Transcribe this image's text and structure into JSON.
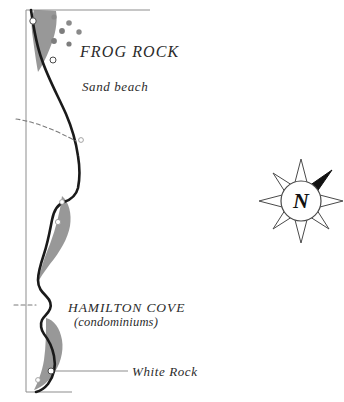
{
  "map": {
    "type": "coastal-illustration-map",
    "background_color": "#ffffff",
    "frame_color": "#8d8d8d",
    "coastline_color": "#1a1a1a",
    "shore_fill_color": "#8f8f8f",
    "trail_color": "#6e6e6e",
    "label_color": "#2b2b2b",
    "labels": [
      {
        "id": "frog-rock",
        "text": "FROG ROCK",
        "style": "italic-caps",
        "x": 80,
        "y": 43
      },
      {
        "id": "sand-beach",
        "text": "Sand beach",
        "style": "italic",
        "x": 82,
        "y": 80
      },
      {
        "id": "hamilton-cove",
        "text": "HAMILTON COVE",
        "style": "italic-caps",
        "x": 68,
        "y": 300
      },
      {
        "id": "hamilton-cove-sub",
        "text": "(condominiums)",
        "style": "italic",
        "x": 74,
        "y": 315
      },
      {
        "id": "white-rock",
        "text": "White Rock",
        "style": "italic",
        "x": 132,
        "y": 365
      }
    ],
    "compass": {
      "id": "compass-rose",
      "center_x": 301,
      "center_y": 201,
      "outer_radius": 42,
      "inner_radius": 20,
      "north_letter": "N",
      "highlighted_point": "northeast",
      "point_count": 8,
      "highlight_color": "#111111",
      "outline_color": "#4a4a4a"
    },
    "rock_markers": [
      {
        "id": "rock-1",
        "x": 54,
        "y": 17,
        "r": 2.6,
        "kind": "star"
      },
      {
        "id": "rock-2",
        "x": 69,
        "y": 23,
        "r": 2.8,
        "kind": "star"
      },
      {
        "id": "rock-3",
        "x": 62,
        "y": 31,
        "r": 2.9,
        "kind": "filled"
      },
      {
        "id": "rock-4",
        "x": 79,
        "y": 32,
        "r": 2.7,
        "kind": "star"
      },
      {
        "id": "rock-5",
        "x": 54,
        "y": 41,
        "r": 2.9,
        "kind": "filled"
      },
      {
        "id": "rock-6",
        "x": 69,
        "y": 44,
        "r": 2.6,
        "kind": "filled"
      },
      {
        "id": "rock-7",
        "x": 53,
        "y": 60,
        "r": 3.0,
        "kind": "open"
      },
      {
        "id": "rock-8",
        "x": 33,
        "y": 21,
        "r": 3.2,
        "kind": "open"
      },
      {
        "id": "rock-9",
        "x": 81,
        "y": 140,
        "r": 2.4,
        "kind": "open-faint"
      },
      {
        "id": "rock-10",
        "x": 62,
        "y": 202,
        "r": 2.4,
        "kind": "open-faint"
      },
      {
        "id": "rock-11",
        "x": 58,
        "y": 222,
        "r": 2.6,
        "kind": "open-faint"
      },
      {
        "id": "rock-12",
        "x": 51,
        "y": 371,
        "r": 3.0,
        "kind": "open"
      },
      {
        "id": "rock-13",
        "x": 38,
        "y": 380,
        "r": 2.4,
        "kind": "open-faint"
      }
    ],
    "leader_lines": [
      {
        "id": "white-rock-leader",
        "x1": 53,
        "y1": 371,
        "x2": 128,
        "y2": 371
      }
    ],
    "trails": [
      {
        "id": "trail-upper",
        "label": "dashed path north"
      },
      {
        "id": "trail-lower",
        "label": "dashed path at cove"
      }
    ],
    "frame": {
      "top_edge": true,
      "left_edge": true,
      "bottom_edge": true,
      "right_edge": false
    }
  }
}
